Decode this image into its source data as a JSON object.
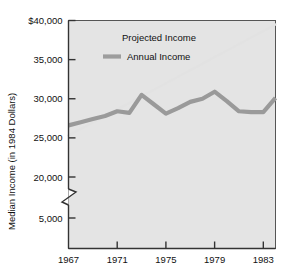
{
  "chart_data": {
    "type": "line",
    "title": "",
    "xlabel": "",
    "ylabel": "Median Income (in 1984 Dollars)",
    "grid": false,
    "legend_position": "top-center-inside",
    "y_axis_break": true,
    "y_break_between": [
      5000,
      20000
    ],
    "ylim": [
      5000,
      40000
    ],
    "xlim": [
      1967,
      1984
    ],
    "y_ticks": [
      40000,
      35000,
      30000,
      25000,
      20000,
      5000
    ],
    "y_tick_labels": [
      "$40,000",
      "35,000",
      "30,000",
      "25,000",
      "20,000",
      "5,000"
    ],
    "x_ticks": [
      1967,
      1971,
      1975,
      1979,
      1983
    ],
    "x_tick_labels": [
      "1967",
      "1971",
      "1975",
      "1979",
      "1983"
    ],
    "series": [
      {
        "name": "Annual Income",
        "color": "#9a9a9a",
        "style": "thick-solid",
        "x": [
          1967,
          1968,
          1969,
          1970,
          1971,
          1972,
          1973,
          1974,
          1975,
          1976,
          1977,
          1978,
          1979,
          1980,
          1981,
          1982,
          1983,
          1984
        ],
        "values": [
          26600,
          27000,
          27400,
          27800,
          28400,
          28200,
          30500,
          29300,
          28100,
          28800,
          29600,
          30000,
          30900,
          29700,
          28400,
          28300,
          28300,
          30100
        ]
      },
      {
        "name": "Projected Income",
        "color": "#e2e2e2",
        "style": "thin-solid",
        "x": [
          1967,
          1984
        ],
        "values": [
          25300,
          39500
        ]
      }
    ],
    "legend": [
      {
        "label": "Projected Income",
        "color": "#e2e2e2",
        "swatch": false
      },
      {
        "label": "Annual Income",
        "color": "#9a9a9a",
        "swatch": true
      }
    ],
    "plot_background": "#e4e4e4",
    "axis_color": "#333333"
  }
}
